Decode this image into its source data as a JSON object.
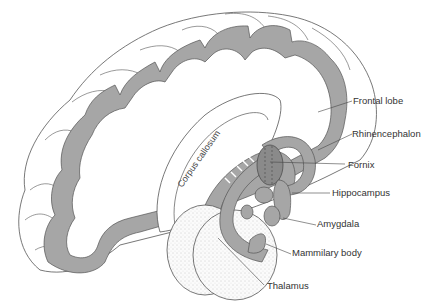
{
  "diagram": {
    "colors": {
      "background": "#ffffff",
      "gray_matter": "#a6a6a6",
      "dark_structure": "#8a8a8a",
      "outline": "#555555",
      "stipple": "#f4f4f4",
      "label_text": "#333333"
    },
    "labels": {
      "frontal_lobe": "Frontal lobe",
      "rhinencephalon": "Rhinencephalon",
      "fornix": "Fornix",
      "hippocampus": "Hippocampus",
      "amygdala": "Amygdala",
      "mammilary_body": "Mammilary body",
      "thalamus": "Thalamus",
      "corpus_callosum": "Corpus callosum"
    }
  }
}
